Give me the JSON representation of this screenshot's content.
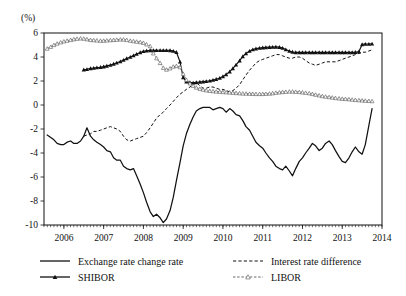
{
  "chart_data": {
    "type": "line",
    "title": "",
    "xlabel": "",
    "ylabel": "",
    "unit_label": "(%)",
    "grid": false,
    "legend_position": "bottom",
    "xlim": [
      2005.5,
      2014.0
    ],
    "ylim": [
      -10,
      6
    ],
    "y_ticks": [
      "6",
      "4",
      "2",
      "0",
      "-2",
      "-4",
      "-6",
      "-8",
      "-10"
    ],
    "y_tick_values": [
      6,
      4,
      2,
      0,
      -2,
      -4,
      -6,
      -8,
      -10
    ],
    "x_ticks": [
      "2006",
      "2007",
      "2008",
      "2009",
      "2010",
      "2011",
      "2012",
      "2013",
      "2014"
    ],
    "x_tick_values": [
      2006,
      2007,
      2008,
      2009,
      2010,
      2011,
      2012,
      2013,
      2014
    ],
    "minor_tick_interval_months": 1,
    "series": [
      {
        "name": "Exchange rate change rate",
        "style": "solid",
        "marker": "none",
        "color": "#111111",
        "x": [
          2005.58,
          2005.67,
          2005.75,
          2005.83,
          2005.92,
          2006.0,
          2006.08,
          2006.17,
          2006.25,
          2006.33,
          2006.42,
          2006.5,
          2006.58,
          2006.67,
          2006.75,
          2006.83,
          2006.92,
          2007.0,
          2007.08,
          2007.17,
          2007.25,
          2007.33,
          2007.42,
          2007.5,
          2007.58,
          2007.67,
          2007.75,
          2007.83,
          2007.92,
          2008.0,
          2008.08,
          2008.17,
          2008.25,
          2008.33,
          2008.42,
          2008.5,
          2008.58,
          2008.67,
          2008.75,
          2008.83,
          2008.92,
          2009.0,
          2009.08,
          2009.17,
          2009.25,
          2009.33,
          2009.42,
          2009.5,
          2009.58,
          2009.67,
          2009.75,
          2009.83,
          2009.92,
          2010.0,
          2010.08,
          2010.17,
          2010.25,
          2010.33,
          2010.42,
          2010.5,
          2010.58,
          2010.67,
          2010.75,
          2010.83,
          2010.92,
          2011.0,
          2011.08,
          2011.17,
          2011.25,
          2011.33,
          2011.42,
          2011.5,
          2011.58,
          2011.67,
          2011.75,
          2011.83,
          2011.92,
          2012.0,
          2012.08,
          2012.17,
          2012.25,
          2012.33,
          2012.42,
          2012.5,
          2012.58,
          2012.67,
          2012.75,
          2012.83,
          2012.92,
          2013.0,
          2013.08,
          2013.17,
          2013.25,
          2013.33,
          2013.42,
          2013.5,
          2013.58,
          2013.67,
          2013.75
        ],
        "values": [
          -2.5,
          -2.7,
          -2.9,
          -3.2,
          -3.3,
          -3.3,
          -3.1,
          -3.0,
          -3.2,
          -3.2,
          -3.0,
          -2.6,
          -1.9,
          -2.6,
          -2.9,
          -3.1,
          -3.3,
          -3.5,
          -3.8,
          -3.9,
          -4.4,
          -4.6,
          -4.6,
          -5.1,
          -5.3,
          -5.4,
          -5.3,
          -5.9,
          -6.6,
          -7.3,
          -8.1,
          -8.9,
          -9.3,
          -9.1,
          -9.4,
          -9.8,
          -9.5,
          -8.8,
          -7.7,
          -6.3,
          -4.8,
          -3.4,
          -2.4,
          -1.6,
          -1.0,
          -0.5,
          -0.3,
          -0.2,
          -0.2,
          -0.2,
          -0.4,
          -0.3,
          -0.2,
          -0.3,
          -0.6,
          -0.3,
          -0.5,
          -0.8,
          -0.9,
          -1.3,
          -1.8,
          -2.1,
          -2.6,
          -3.1,
          -3.4,
          -3.6,
          -4.0,
          -4.4,
          -4.7,
          -5.1,
          -5.3,
          -5.4,
          -5.1,
          -5.5,
          -5.9,
          -5.3,
          -4.7,
          -4.4,
          -4.0,
          -3.6,
          -3.2,
          -3.4,
          -3.8,
          -3.6,
          -3.2,
          -3.0,
          -3.3,
          -3.8,
          -4.3,
          -4.7,
          -4.8,
          -4.4,
          -3.9,
          -3.5,
          -3.9,
          -4.1,
          -3.3,
          -1.7,
          -0.3
        ]
      },
      {
        "name": "Interest rate difference",
        "style": "dashed",
        "marker": "none",
        "color": "#111111",
        "x": [
          2006.5,
          2006.58,
          2006.67,
          2006.75,
          2006.83,
          2006.92,
          2007.0,
          2007.08,
          2007.17,
          2007.25,
          2007.33,
          2007.42,
          2007.5,
          2007.58,
          2007.67,
          2007.75,
          2007.83,
          2007.92,
          2008.0,
          2008.08,
          2008.17,
          2008.25,
          2008.33,
          2008.42,
          2008.5,
          2008.58,
          2008.67,
          2008.75,
          2008.83,
          2008.92,
          2009.0,
          2009.08,
          2009.17,
          2009.25,
          2009.33,
          2009.42,
          2009.5,
          2009.58,
          2009.67,
          2009.75,
          2009.83,
          2009.92,
          2010.0,
          2010.08,
          2010.17,
          2010.25,
          2010.33,
          2010.42,
          2010.5,
          2010.58,
          2010.67,
          2010.75,
          2010.83,
          2010.92,
          2011.0,
          2011.08,
          2011.17,
          2011.25,
          2011.33,
          2011.42,
          2011.5,
          2011.58,
          2011.67,
          2011.75,
          2011.83,
          2011.92,
          2012.0,
          2012.08,
          2012.17,
          2012.25,
          2012.33,
          2012.42,
          2012.5,
          2012.58,
          2012.67,
          2012.75,
          2012.83,
          2012.92,
          2013.0,
          2013.08,
          2013.17,
          2013.25,
          2013.33,
          2013.42,
          2013.5,
          2013.58,
          2013.67,
          2013.75
        ],
        "values": [
          -2.6,
          -2.5,
          -2.4,
          -2.2,
          -2.2,
          -2.1,
          -2.0,
          -1.9,
          -1.8,
          -1.9,
          -2.0,
          -2.2,
          -2.6,
          -2.9,
          -3.0,
          -2.9,
          -2.8,
          -2.7,
          -2.6,
          -2.3,
          -1.9,
          -1.5,
          -1.1,
          -0.8,
          -0.6,
          -0.3,
          0.0,
          0.3,
          0.6,
          0.9,
          1.1,
          1.3,
          1.5,
          1.7,
          1.9,
          1.6,
          1.4,
          1.4,
          1.5,
          1.5,
          1.4,
          1.3,
          1.3,
          1.2,
          1.1,
          1.2,
          1.4,
          1.7,
          2.1,
          2.5,
          2.9,
          3.2,
          3.5,
          3.7,
          3.8,
          3.9,
          4.0,
          4.1,
          4.2,
          4.2,
          4.1,
          4.0,
          3.9,
          3.9,
          4.0,
          4.0,
          3.9,
          3.7,
          3.5,
          3.4,
          3.3,
          3.4,
          3.5,
          3.6,
          3.6,
          3.6,
          3.6,
          3.7,
          3.8,
          3.9,
          4.0,
          4.1,
          4.2,
          4.3,
          4.4,
          4.4,
          4.5,
          4.6
        ]
      },
      {
        "name": "SHIBOR",
        "style": "solid",
        "marker": "triangle-filled",
        "color": "#111111",
        "x": [
          2006.5,
          2006.58,
          2006.67,
          2006.75,
          2006.83,
          2006.92,
          2007.0,
          2007.08,
          2007.17,
          2007.25,
          2007.33,
          2007.42,
          2007.5,
          2007.58,
          2007.67,
          2007.75,
          2007.83,
          2007.92,
          2008.0,
          2008.08,
          2008.17,
          2008.25,
          2008.33,
          2008.42,
          2008.5,
          2008.58,
          2008.67,
          2008.75,
          2008.83,
          2008.92,
          2009.0,
          2009.08,
          2009.17,
          2009.25,
          2009.33,
          2009.42,
          2009.5,
          2009.58,
          2009.67,
          2009.75,
          2009.83,
          2009.92,
          2010.0,
          2010.08,
          2010.17,
          2010.25,
          2010.33,
          2010.42,
          2010.5,
          2010.58,
          2010.67,
          2010.75,
          2010.83,
          2010.92,
          2011.0,
          2011.08,
          2011.17,
          2011.25,
          2011.33,
          2011.42,
          2011.5,
          2011.58,
          2011.67,
          2011.75,
          2011.83,
          2011.92,
          2012.0,
          2012.08,
          2012.17,
          2012.25,
          2012.33,
          2012.42,
          2012.5,
          2012.58,
          2012.67,
          2012.75,
          2012.83,
          2012.92,
          2013.0,
          2013.08,
          2013.17,
          2013.25,
          2013.33,
          2013.42,
          2013.5,
          2013.58,
          2013.67,
          2013.75
        ],
        "values": [
          2.95,
          2.98,
          3.05,
          3.08,
          3.12,
          3.15,
          3.2,
          3.26,
          3.33,
          3.42,
          3.52,
          3.62,
          3.75,
          3.88,
          4.0,
          4.12,
          4.25,
          4.38,
          4.48,
          4.52,
          4.55,
          4.55,
          4.56,
          4.56,
          4.56,
          4.56,
          4.55,
          4.5,
          4.4,
          3.6,
          2.3,
          1.95,
          1.88,
          1.85,
          1.88,
          1.92,
          1.95,
          1.98,
          2.02,
          2.08,
          2.15,
          2.25,
          2.38,
          2.55,
          2.78,
          3.05,
          3.35,
          3.7,
          4.05,
          4.3,
          4.5,
          4.62,
          4.7,
          4.75,
          4.78,
          4.8,
          4.82,
          4.83,
          4.84,
          4.82,
          4.75,
          4.62,
          4.5,
          4.42,
          4.38,
          4.38,
          4.38,
          4.38,
          4.38,
          4.38,
          4.38,
          4.38,
          4.38,
          4.38,
          4.38,
          4.38,
          4.38,
          4.38,
          4.38,
          4.38,
          4.38,
          4.38,
          4.4,
          4.45,
          5.05,
          5.08,
          5.08,
          5.1
        ]
      },
      {
        "name": "LIBOR",
        "style": "dashed",
        "marker": "triangle-open",
        "color": "#555555",
        "x": [
          2005.58,
          2005.67,
          2005.75,
          2005.83,
          2005.92,
          2006.0,
          2006.08,
          2006.17,
          2006.25,
          2006.33,
          2006.42,
          2006.5,
          2006.58,
          2006.67,
          2006.75,
          2006.83,
          2006.92,
          2007.0,
          2007.08,
          2007.17,
          2007.25,
          2007.33,
          2007.42,
          2007.5,
          2007.58,
          2007.67,
          2007.75,
          2007.83,
          2007.92,
          2008.0,
          2008.08,
          2008.17,
          2008.25,
          2008.33,
          2008.42,
          2008.5,
          2008.58,
          2008.67,
          2008.75,
          2008.83,
          2008.92,
          2009.0,
          2009.08,
          2009.17,
          2009.25,
          2009.33,
          2009.42,
          2009.5,
          2009.58,
          2009.67,
          2009.75,
          2009.83,
          2009.92,
          2010.0,
          2010.08,
          2010.17,
          2010.25,
          2010.33,
          2010.42,
          2010.5,
          2010.58,
          2010.67,
          2010.75,
          2010.83,
          2010.92,
          2011.0,
          2011.08,
          2011.17,
          2011.25,
          2011.33,
          2011.42,
          2011.5,
          2011.58,
          2011.67,
          2011.75,
          2011.83,
          2011.92,
          2012.0,
          2012.08,
          2012.17,
          2012.25,
          2012.33,
          2012.42,
          2012.5,
          2012.58,
          2012.67,
          2012.75,
          2012.83,
          2012.92,
          2013.0,
          2013.08,
          2013.17,
          2013.25,
          2013.33,
          2013.42,
          2013.5,
          2013.58,
          2013.67,
          2013.75
        ],
        "values": [
          4.7,
          4.85,
          5.0,
          5.12,
          5.22,
          5.3,
          5.36,
          5.42,
          5.48,
          5.52,
          5.55,
          5.53,
          5.48,
          5.42,
          5.4,
          5.38,
          5.36,
          5.36,
          5.38,
          5.4,
          5.42,
          5.44,
          5.46,
          5.46,
          5.42,
          5.36,
          5.32,
          5.28,
          5.24,
          5.18,
          5.05,
          4.9,
          4.3,
          3.9,
          3.5,
          3.1,
          2.95,
          3.05,
          3.2,
          3.25,
          3.15,
          2.6,
          2.1,
          1.8,
          1.6,
          1.45,
          1.35,
          1.28,
          1.22,
          1.18,
          1.15,
          1.12,
          1.1,
          1.08,
          1.06,
          1.04,
          1.02,
          1.0,
          0.98,
          0.96,
          0.95,
          0.94,
          0.93,
          0.92,
          0.92,
          0.92,
          0.93,
          0.95,
          0.98,
          1.02,
          1.05,
          1.08,
          1.1,
          1.12,
          1.12,
          1.1,
          1.08,
          1.05,
          1.02,
          0.98,
          0.92,
          0.86,
          0.8,
          0.74,
          0.7,
          0.66,
          0.62,
          0.58,
          0.55,
          0.52,
          0.5,
          0.48,
          0.45,
          0.42,
          0.4,
          0.38,
          0.36,
          0.34,
          0.32
        ]
      }
    ]
  },
  "legend": {
    "items": [
      {
        "label": "Exchange rate change rate",
        "style": "solid",
        "marker": "none"
      },
      {
        "label": "Interest rate difference",
        "style": "dashed",
        "marker": "none"
      },
      {
        "label": "SHIBOR",
        "style": "solid",
        "marker": "triangle-filled"
      },
      {
        "label": "LIBOR",
        "style": "dashed",
        "marker": "triangle-open"
      }
    ]
  }
}
